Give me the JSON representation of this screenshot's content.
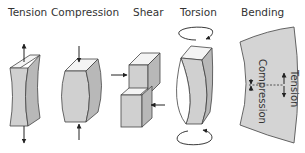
{
  "diagram": {
    "title_labels": [
      {
        "id": "tension",
        "text": "Tension"
      },
      {
        "id": "compression",
        "text": "Compression"
      },
      {
        "id": "shear",
        "text": "Shear"
      },
      {
        "id": "torsion",
        "text": "Torsion"
      },
      {
        "id": "bending",
        "text": "Bending"
      }
    ],
    "bending_side_labels": {
      "inner": "Compression",
      "outer": "Tension"
    }
  },
  "colors": {
    "face_front": "#d0d0d0",
    "face_side": "#b8b8b8",
    "face_top": "#f4f4f4",
    "stroke": "#444444",
    "text": "#333333"
  }
}
